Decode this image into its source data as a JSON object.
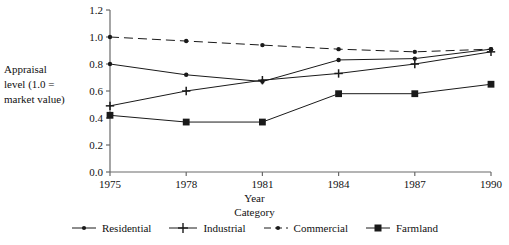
{
  "chart_data": {
    "type": "line",
    "title": "",
    "xlabel": "Year",
    "ylabel": "Appraisal level (1.0 = market value)",
    "x": [
      1975,
      1978,
      1981,
      1984,
      1987,
      1990
    ],
    "xticklabels": [
      "1975",
      "1978",
      "1981",
      "1984",
      "1987",
      "1990"
    ],
    "yticklabels": [
      "0.0",
      "0.2",
      "0.4",
      "0.6",
      "0.8",
      "1.0",
      "1.2"
    ],
    "yticks": [
      0.0,
      0.2,
      0.4,
      0.6,
      0.8,
      1.0,
      1.2
    ],
    "ylim": [
      0.0,
      1.2
    ],
    "xlim": [
      1975,
      1990
    ],
    "grid": false,
    "legend_position": "bottom",
    "legend_title": "Category",
    "series": [
      {
        "name": "Residential",
        "marker": "dot",
        "linestyle": "solid",
        "color": "#1a1a1a",
        "values": [
          0.8,
          0.72,
          0.67,
          0.83,
          0.84,
          0.91
        ]
      },
      {
        "name": "Industrial",
        "marker": "plus",
        "linestyle": "solid",
        "color": "#1a1a1a",
        "values": [
          0.49,
          0.6,
          0.68,
          0.73,
          0.8,
          0.89
        ]
      },
      {
        "name": "Commercial",
        "marker": "dot",
        "linestyle": "dashed",
        "color": "#1a1a1a",
        "values": [
          1.0,
          0.97,
          0.94,
          0.91,
          0.89,
          0.91
        ]
      },
      {
        "name": "Farmland",
        "marker": "square",
        "linestyle": "solid",
        "color": "#1a1a1a",
        "values": [
          0.42,
          0.37,
          0.37,
          0.58,
          0.58,
          0.65
        ]
      }
    ]
  },
  "labels": {
    "y_axis_title_line1": "Appraisal",
    "y_axis_title_line2": "level (1.0 =",
    "y_axis_title_line3": "market value)",
    "x_axis_title": "Year",
    "legend_title": "Category"
  },
  "legend": {
    "items": [
      {
        "label": "Residential"
      },
      {
        "label": "Industrial"
      },
      {
        "label": "Commercial"
      },
      {
        "label": "Farmland"
      }
    ]
  }
}
